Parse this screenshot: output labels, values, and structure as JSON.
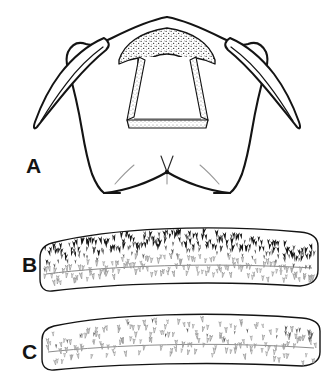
{
  "figure": {
    "kind": "scientific-line-illustration",
    "background_color": "#ffffff",
    "ink_color": "#141414",
    "light_ink_color": "#8d8d8d",
    "mid_ink_color": "#5a5a5a",
    "width": 335,
    "height": 385,
    "panel_count": 3
  },
  "panels": [
    {
      "id": "A",
      "label": "A",
      "label_x": 26,
      "label_y": 173,
      "subject": "head-capsule-dorsal-view",
      "features": [
        "paired lateral horns",
        "stippled arched clypeal band",
        "open trapezoidal frame",
        "ventral v-notch with apical setae"
      ]
    },
    {
      "id": "B",
      "label": "B",
      "label_x": 22,
      "label_y": 272,
      "subject": "curved-sclerite-band-dense-spines",
      "features": [
        "dense dark spines along upper margin",
        "lighter setae toward lower margin"
      ]
    },
    {
      "id": "C",
      "label": "C",
      "label_x": 22,
      "label_y": 359,
      "subject": "curved-sclerite-band-sparse-setae",
      "features": [
        "uniform fine pale setae",
        "few darker spines at upper right"
      ]
    }
  ]
}
